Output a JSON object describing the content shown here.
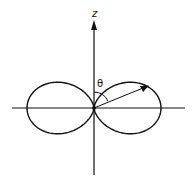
{
  "diagram": {
    "axis_label_z": "z",
    "angle_label": "θ",
    "pattern": "sin^2(theta)",
    "stroke_color": "#111111",
    "background_color": "#ffffff"
  }
}
